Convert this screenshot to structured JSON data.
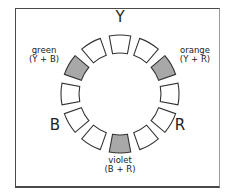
{
  "diagram": {
    "type": "color-wheel",
    "segment_count": 12,
    "primaries": {
      "top": "Y",
      "left": "B",
      "right": "R"
    },
    "secondaries": [
      {
        "name": "green",
        "formula": "(Y + B)",
        "position": "upper-left"
      },
      {
        "name": "orange",
        "formula": "(Y + R)",
        "position": "upper-right"
      },
      {
        "name": "violet",
        "formula": "(B + R)",
        "position": "bottom"
      }
    ],
    "colors": {
      "segment_fill": "#ffffff",
      "shaded_fill": "#a8a8a8",
      "stroke": "#333333"
    },
    "shaded_segments": [
      2,
      6,
      10
    ]
  }
}
